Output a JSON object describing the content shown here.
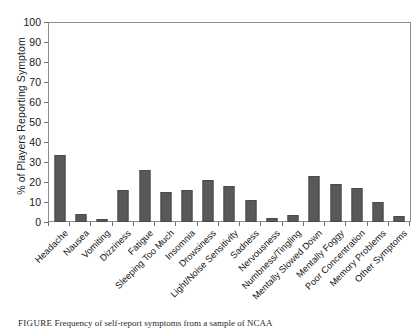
{
  "chart_data": {
    "type": "bar",
    "title": "",
    "xlabel": "",
    "ylabel": "% of Players Reporting Symptom",
    "ylim": [
      0,
      100
    ],
    "yticks": [
      0,
      10,
      20,
      30,
      40,
      50,
      60,
      70,
      80,
      90,
      100
    ],
    "grid": false,
    "legend": null,
    "bar_color": "#59595b",
    "categories": [
      "Headache",
      "Nausea",
      "Vomiting",
      "Dizziness",
      "Fatigue",
      "Sleeping Too Much",
      "Insomnia",
      "Drowsiness",
      "Light/Noise Sensitivity",
      "Sadness",
      "Nervousness",
      "Numbness/Tingling",
      "Mentally Slowed Down",
      "Mentally Foggy",
      "Poor Concentration",
      "Memory Problems",
      "Other Symptoms"
    ],
    "values": [
      33.5,
      4,
      1.5,
      16,
      26,
      15,
      16,
      21,
      18,
      11,
      2,
      3.5,
      23,
      19,
      17,
      10,
      3
    ]
  },
  "caption": {
    "label": "FIGURE",
    "text": "Frequency of self-report symptoms from a sample of NCAA"
  }
}
